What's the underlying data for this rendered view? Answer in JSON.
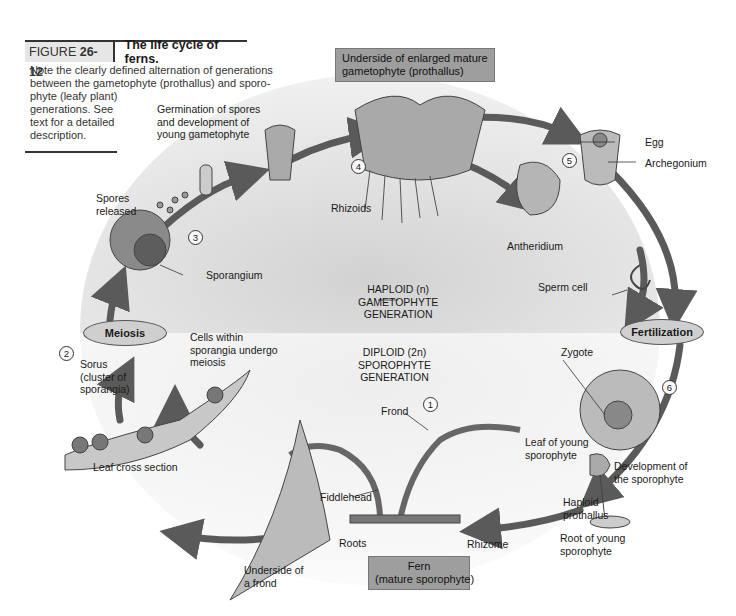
{
  "caption": {
    "figure_label": "FIGURE",
    "figure_number": "26-12",
    "title": "The life cycle of ferns.",
    "body_lines": [
      "Note the clearly defined alternation of generations",
      "between the gametophyte (prothallus) and sporo-",
      "phyte (leafy plant)",
      "generations. See",
      "text for a detailed",
      "description."
    ]
  },
  "boxes": {
    "gametophyte": "Underside of enlarged mature\ngametophyte (prothallus)",
    "fern": "Fern\n(mature sporophyte)"
  },
  "events": {
    "meiosis": "Meiosis",
    "fertilization": "Fertilization"
  },
  "generations": {
    "haploid": "HAPLOID (n)\nGAMETOPHYTE\nGENERATION",
    "diploid": "DIPLOID (2n)\nSPOROPHYTE\nGENERATION"
  },
  "steps": [
    "1",
    "2",
    "3",
    "4",
    "5",
    "6"
  ],
  "labels": {
    "germination": "Germination of spores\nand development of\nyoung gametophyte",
    "spores_released": "Spores\nreleased",
    "sporangium": "Sporangium",
    "rhizoids": "Rhizoids",
    "egg": "Egg",
    "archegonium": "Archegonium",
    "antheridium": "Antheridium",
    "sperm_cell": "Sperm cell",
    "zygote": "Zygote",
    "cells_meiosis": "Cells within\nsporangia undergo\nmeiosis",
    "sorus": "Sorus\n(cluster of\nsporangia)",
    "leaf_cross_section": "Leaf cross section",
    "frond": "Frond",
    "fiddlehead": "Fiddlehead",
    "roots": "Roots",
    "rhizome": "Rhizome",
    "leaf_young": "Leaf of young\nsporophyte",
    "development": "Development of\nthe sporophyte",
    "haploid_prothallus": "Haploid\nprothallus",
    "root_young": "Root of young\nsporophyte",
    "underside_frond": "Underside of\na frond"
  },
  "colors": {
    "haploid_bg": "#d4d4d4",
    "diploid_bg": "#ececec",
    "arrow": "#5a5a5a",
    "box": "#9e9e9e",
    "oval": "#cfcfcf"
  }
}
